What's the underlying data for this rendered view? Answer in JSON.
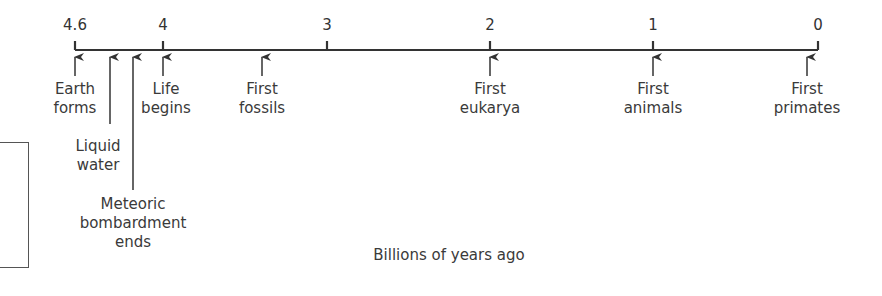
{
  "diagram": {
    "type": "timeline",
    "axis": {
      "label": "Billions of years ago",
      "ticks": [
        {
          "label": "4.6",
          "value": 4.6,
          "x": 75
        },
        {
          "label": "4",
          "value": 4,
          "x": 163
        },
        {
          "label": "3",
          "value": 3,
          "x": 327
        },
        {
          "label": "2",
          "value": 2,
          "x": 490
        },
        {
          "label": "1",
          "value": 1,
          "x": 653
        },
        {
          "label": "0",
          "value": 0,
          "x": 818
        }
      ]
    },
    "events": [
      {
        "id": "earth",
        "line1": "Earth",
        "line2": "forms",
        "line3": "",
        "approx_bya": 4.6
      },
      {
        "id": "water",
        "line1": "Liquid",
        "line2": "water",
        "line3": "",
        "approx_bya": 4.4
      },
      {
        "id": "meteoric",
        "line1": "Meteoric",
        "line2": "bombardment",
        "line3": "ends",
        "approx_bya": 4.2
      },
      {
        "id": "life",
        "line1": "Life",
        "line2": "begins",
        "line3": "",
        "approx_bya": 4.0
      },
      {
        "id": "fossils",
        "line1": "First",
        "line2": "fossils",
        "line3": "",
        "approx_bya": 3.5
      },
      {
        "id": "eukarya",
        "line1": "First",
        "line2": "eukarya",
        "line3": "",
        "approx_bya": 2.0
      },
      {
        "id": "animals",
        "line1": "First",
        "line2": "animals",
        "line3": "",
        "approx_bya": 1.0
      },
      {
        "id": "primates",
        "line1": "First",
        "line2": "primates",
        "line3": "",
        "approx_bya": 0.07
      }
    ]
  }
}
